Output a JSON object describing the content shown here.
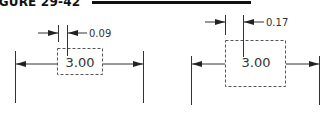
{
  "figure": {
    "title": "IGURE 29-42",
    "rule_color": "#111111"
  },
  "drawings": [
    {
      "id": "left",
      "basic_dimension": "3.00",
      "tolerance_leader": "0.09"
    },
    {
      "id": "right",
      "basic_dimension": "3.00",
      "tolerance_leader": "0.17"
    }
  ],
  "colors": {
    "line": "#333333",
    "dashed_box": "#555555",
    "background": "#ffffff"
  }
}
